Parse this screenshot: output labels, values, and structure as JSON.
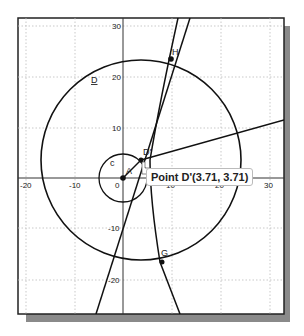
{
  "canvas": {
    "x_ticks": [
      "-20",
      "-10",
      "0",
      "10",
      "20",
      "30"
    ],
    "y_ticks": [
      "30",
      "20",
      "10",
      "-10",
      "-20"
    ],
    "labels": {
      "circle_big": "D",
      "circle_small": "c",
      "point_A": "A",
      "point_D_prime": "D'",
      "point_H": "H",
      "point_G": "G"
    },
    "tooltip": "Point D'(3.71, 3.71)"
  }
}
